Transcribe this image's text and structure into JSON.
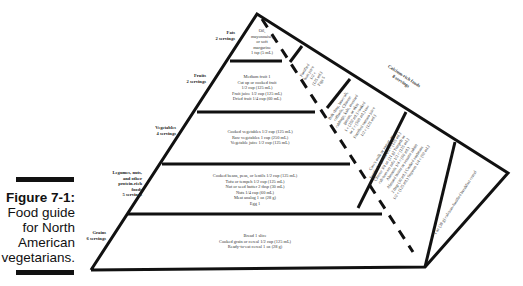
{
  "figure": {
    "number": "Figure 7-1:",
    "caption_lines": [
      "Food guide",
      "for North",
      "American",
      "vegetarians."
    ]
  },
  "pyramid": {
    "groups": [
      {
        "name": "Fats",
        "servings": "2 servings",
        "items": [
          "Oil,",
          "mayonnaise,",
          "or soft",
          "margarine",
          "1 tsp (5 mL)"
        ]
      },
      {
        "name": "Fruits",
        "servings": "2 servings",
        "items": [
          "Medium fruit 1",
          "Cut up or cooked fruit",
          "1/2 cup (125 mL)",
          "Fruit juice 1/2 cup (125 mL)",
          "Dried fruit 1/4 cup (60 mL)"
        ]
      },
      {
        "name": "Vegetables",
        "servings": "4 servings",
        "items": [
          "Cooked vegetables 1/2 cup (125 mL)",
          "Raw vegetables 1 cup (250 mL)",
          "Vegetable juice 1/2 cup (125 mL)"
        ]
      },
      {
        "name_lines": [
          "Legumes, nuts,",
          "and other",
          "protein-rich",
          "foods"
        ],
        "servings": "5 servings",
        "items": [
          "Cooked beans, peas, or lentils 1/2 cup (125 mL)",
          "Tofu or tempeh 1/2 cup (125 mL)",
          "Nut or seed butter 2 tbsp (30 mL)",
          "Nuts 1/4 cup (60 mL)",
          "Meat analog 1 oz (28 g)",
          "Egg 1"
        ]
      },
      {
        "name": "Grains",
        "servings": "6 servings",
        "items": [
          "Bread 1 slice",
          "Cooked grain or cereal 1/2 cup (125 mL)",
          "Ready-to-eat cereal 1 oz (28 g)"
        ]
      }
    ],
    "calcium": {
      "name": "Calcium-rich foods",
      "servings": "8 servings",
      "sections": [
        {
          "items": [
            "Fortified",
            "fruit juice",
            "1/2 c",
            "(125 mL)",
            "Figs 5"
          ]
        },
        {
          "items": [
            "Bok choy, broccoli,",
            "collards, Chinese",
            "cabbage, kale, mustard",
            "greens, or okra",
            "1 c (250 mL) cooked",
            "or 2 c (500 mL) raw",
            "Fortified tomato juice",
            "1/2 c (125 mL)"
          ]
        },
        {
          "items": [
            "Cow's milk or yogurt, or",
            "fortified soymilk 1/2 c (125 mL)",
            "Cheese 3/4 oz (21 g) Tempeh or",
            "calcium-set tofu 1/2 c (125 mL)",
            "Almonds 1/4 c (60 mL)",
            "Almond butter or sesame tahini",
            "2 tbsp (30 mL) Cooked soybeans",
            "1/2 c (125 mL) Soynuts 1/4 c (60 mL)"
          ]
        },
        {
          "items": [
            "1 oz (28 g) calcium-fortified breakfast cereal"
          ]
        }
      ]
    }
  }
}
